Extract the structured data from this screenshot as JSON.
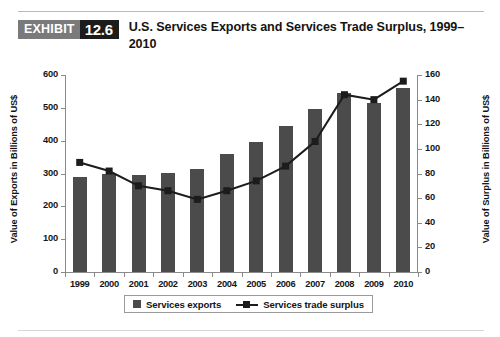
{
  "header": {
    "exhibit_word": "EXHIBIT",
    "exhibit_number": "12.6",
    "title": "U.S. Services Exports and Services Trade Surplus, 1999–2010"
  },
  "legend": {
    "items": [
      {
        "label": "Services exports",
        "marker": "bar-swatch",
        "color": "#4b4b4b"
      },
      {
        "label": "Services trade surplus",
        "marker": "line-square-marker",
        "color": "#1c1c1c"
      }
    ]
  },
  "chart_data": {
    "type": "bar",
    "title": "U.S. Services Exports and Services Trade Surplus, 1999–2010",
    "xlabel": "",
    "ylabel": "Value of Exports in Billions of US$",
    "y2label": "Value of Surplus in Billions of US$",
    "categories": [
      "1999",
      "2000",
      "2001",
      "2002",
      "2003",
      "2004",
      "2005",
      "2006",
      "2007",
      "2008",
      "2009",
      "2010"
    ],
    "ylim": [
      0,
      600
    ],
    "y2lim": [
      0,
      160
    ],
    "yticks": [
      0,
      100,
      200,
      300,
      400,
      500,
      600
    ],
    "y2ticks": [
      0,
      20,
      40,
      60,
      80,
      100,
      120,
      140,
      160
    ],
    "grid": false,
    "legend_position": "bottom",
    "series": [
      {
        "name": "Services exports",
        "type": "bar",
        "axis": "left",
        "color": "#4b4b4b",
        "values": [
          290,
          300,
          296,
          302,
          315,
          360,
          395,
          445,
          495,
          545,
          515,
          560
        ]
      },
      {
        "name": "Services trade surplus",
        "type": "line",
        "axis": "right",
        "color": "#1c1c1c",
        "values": [
          89,
          82,
          70,
          66,
          59,
          66,
          74,
          86,
          106,
          144,
          140,
          155
        ]
      }
    ]
  }
}
